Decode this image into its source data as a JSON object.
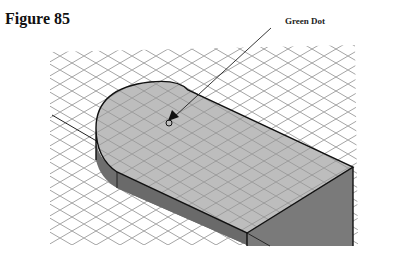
{
  "figure": {
    "title": "Figure 85",
    "callout_label": "Green Dot"
  },
  "colors": {
    "background": "#ffffff",
    "grid": "#9a9a9a",
    "top_face": "#bdbdbd",
    "side_face": "#6e6e6e",
    "front_face": "#7a7a7a",
    "edge": "#111111"
  }
}
